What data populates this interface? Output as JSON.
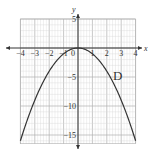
{
  "chart_data": {
    "type": "line",
    "title": "",
    "panel_label": "D",
    "xlabel": "x",
    "ylabel": "y",
    "xlim": [
      -4,
      4
    ],
    "ylim": [
      -16.5,
      5
    ],
    "grid": true,
    "x_ticks": [
      -4,
      -3,
      -2,
      -1,
      0,
      1,
      2,
      3,
      4
    ],
    "x_tick_labels": [
      "−4",
      "−3",
      "−2",
      "−1",
      "0",
      "1",
      "2",
      "3",
      "4"
    ],
    "y_ticks": [
      5,
      -5,
      -10,
      -15
    ],
    "y_tick_labels": [
      "5",
      "−5",
      "−10",
      "−15"
    ],
    "series": [
      {
        "name": "y = -x^2",
        "function": "-x^2",
        "x": [
          -4,
          -3.5,
          -3,
          -2.5,
          -2,
          -1.5,
          -1,
          -0.5,
          0,
          0.5,
          1,
          1.5,
          2,
          2.5,
          3,
          3.5,
          4
        ],
        "y": [
          -16,
          -12.25,
          -9,
          -6.25,
          -4,
          -2.25,
          -1,
          -0.25,
          0,
          -0.25,
          -1,
          -2.25,
          -4,
          -6.25,
          -9,
          -12.25,
          -16
        ]
      }
    ]
  },
  "colors": {
    "grid_minor": "#d8d8d8",
    "grid_major": "#b0b0b0",
    "axis": "#333333",
    "curve": "#333333"
  }
}
